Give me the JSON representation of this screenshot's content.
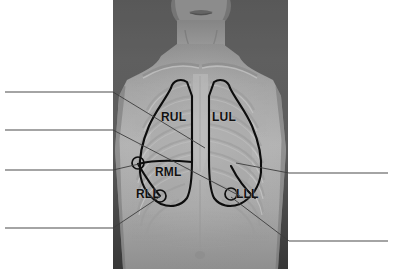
{
  "figure": {
    "photo": {
      "description": "Anterior view photograph of a male torso with lung lobe outlines and rib cage overlay",
      "x": 113,
      "y": 0,
      "width": 175,
      "height": 269
    },
    "lobe_labels": [
      {
        "id": "rul",
        "text": "RUL",
        "meaning": "Right Upper Lobe",
        "x": 161,
        "y": 111
      },
      {
        "id": "lul",
        "text": "LUL",
        "meaning": "Left Upper Lobe",
        "x": 212,
        "y": 111
      },
      {
        "id": "rml",
        "text": "RML",
        "meaning": "Right Middle Lobe",
        "x": 155,
        "y": 166
      },
      {
        "id": "rll",
        "text": "RLL",
        "meaning": "Right Lower Lobe",
        "x": 136,
        "y": 188
      },
      {
        "id": "lll",
        "text": "LLL",
        "meaning": "Left Lower Lobe",
        "x": 236,
        "y": 188
      }
    ],
    "answer_blanks": {
      "left": [
        {
          "id": "left-blank-1",
          "value": "",
          "line_y": 92,
          "x1": 5,
          "x2": 113
        },
        {
          "id": "left-blank-2",
          "value": "",
          "line_y": 130,
          "x1": 5,
          "x2": 113
        },
        {
          "id": "left-blank-3",
          "value": "",
          "line_y": 170,
          "x1": 5,
          "x2": 113
        },
        {
          "id": "left-blank-4",
          "value": "",
          "line_y": 228,
          "x1": 5,
          "x2": 113
        }
      ],
      "right": [
        {
          "id": "right-blank-1",
          "value": "",
          "line_y": 173,
          "x1": 289,
          "x2": 388
        },
        {
          "id": "right-blank-2",
          "value": "",
          "line_y": 241,
          "x1": 289,
          "x2": 388
        }
      ]
    },
    "markers": [
      {
        "id": "marker-right-horizontal-fissure",
        "cx": 138,
        "cy": 163,
        "r": 6
      },
      {
        "id": "marker-right-oblique-fissure",
        "cx": 160,
        "cy": 196,
        "r": 6
      },
      {
        "id": "marker-left-oblique-fissure",
        "cx": 231,
        "cy": 194,
        "r": 6
      }
    ],
    "colors": {
      "background": "#ffffff",
      "leader_line": "#4a4a4a",
      "label_text": "#111111",
      "outline": "#0d0d0d"
    }
  }
}
